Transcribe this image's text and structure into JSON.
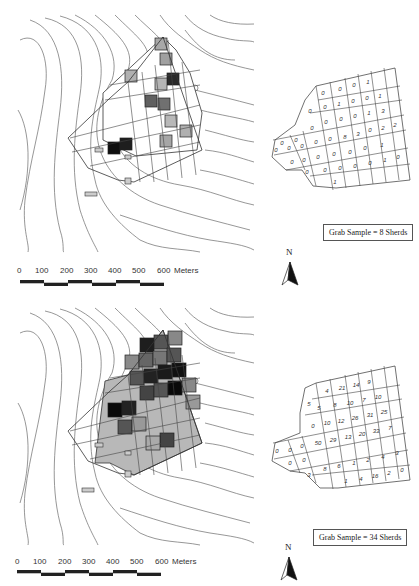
{
  "figure": {
    "panels": [
      {
        "id": "top",
        "legend": "Grab Sample = 8 Sherds",
        "north_label": "N",
        "scale": {
          "ticks": [
            "0",
            "100",
            "200",
            "300",
            "400",
            "500",
            "600"
          ],
          "unit": "Meters"
        },
        "grid_rows": [
          {
            "row": 0,
            "values": [
              "0",
              "0",
              "0",
              "1"
            ]
          },
          {
            "row": 1,
            "values": [
              "0",
              "0",
              "1",
              "0",
              "0",
              "1"
            ]
          },
          {
            "row": 2,
            "values": [
              "0",
              "0",
              "0",
              "0",
              "0",
              "0",
              "1",
              "3"
            ]
          },
          {
            "row": 3,
            "values": [
              "0",
              "0",
              "8",
              "3",
              "0",
              "2",
              "2",
              "0"
            ]
          },
          {
            "row": 4,
            "values": [
              "0",
              "0",
              "0",
              "0",
              "0",
              "1",
              "0"
            ]
          },
          {
            "row": 5,
            "values": [
              "0",
              "0",
              "0",
              "0",
              "1",
              "0",
              "1"
            ]
          }
        ],
        "cells_flat": [
          "0",
          "0",
          "0",
          "1",
          "0",
          "0",
          "1",
          "0",
          "0",
          "1",
          "0",
          "0",
          "0",
          "0",
          "0",
          "0",
          "1",
          "3",
          "0",
          "0",
          "0",
          "0",
          "0",
          "8",
          "3",
          "0",
          "2",
          "2",
          "0",
          "0",
          "0",
          "0",
          "0",
          "0",
          "1",
          "0",
          "0",
          "0",
          "0",
          "0",
          "1",
          "0",
          "1"
        ]
      },
      {
        "id": "bottom",
        "legend": "Grab Sample = 34 Sherds",
        "north_label": "N",
        "scale": {
          "ticks": [
            "0",
            "100",
            "200",
            "300",
            "400",
            "500",
            "600"
          ],
          "unit": "Meters"
        },
        "cells_flat": [
          "4",
          "21",
          "14",
          "9",
          "5",
          "5",
          "8",
          "10",
          "7",
          "10",
          "0",
          "10",
          "12",
          "26",
          "31",
          "25",
          "0",
          "0",
          "0",
          "50",
          "29",
          "13",
          "20",
          "33",
          "7",
          "0",
          "0",
          "3",
          "8",
          "6",
          "1",
          "2",
          "4",
          "3",
          "1",
          "4",
          "16",
          "2",
          "0"
        ]
      }
    ]
  }
}
